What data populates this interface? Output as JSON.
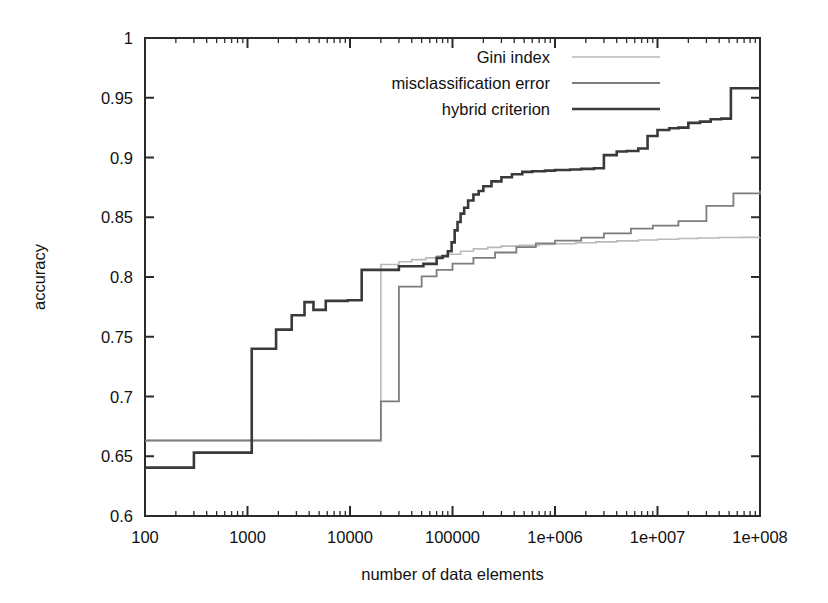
{
  "chart_data": {
    "type": "line",
    "title": "",
    "xlabel": "number of data elements",
    "ylabel": "accuracy",
    "xscale": "log",
    "xlim": [
      100,
      100000000
    ],
    "ylim": [
      0.6,
      1.0
    ],
    "grid": false,
    "legend_position": "top-right-inside",
    "xticks": [
      100,
      1000,
      10000,
      100000,
      1000000,
      10000000,
      100000000
    ],
    "xtick_labels": [
      "100",
      "1000",
      "10000",
      "100000",
      "1e+006",
      "1e+007",
      "1e+008"
    ],
    "yticks": [
      0.6,
      0.65,
      0.7,
      0.75,
      0.8,
      0.85,
      0.9,
      0.95,
      1
    ],
    "ytick_labels": [
      "0.6",
      "0.65",
      "0.7",
      "0.75",
      "0.8",
      "0.85",
      "0.9",
      "0.95",
      "1"
    ],
    "series": [
      {
        "name": "Gini index",
        "color": "#b9b9b9",
        "width": 1.6,
        "step": "post",
        "points": [
          [
            100,
            0.6632
          ],
          [
            300,
            0.6632
          ],
          [
            1000,
            0.6632
          ],
          [
            3000,
            0.6632
          ],
          [
            10000,
            0.6632
          ],
          [
            19000,
            0.6632
          ],
          [
            20000,
            0.8105
          ],
          [
            26000,
            0.8105
          ],
          [
            30000,
            0.8128
          ],
          [
            40000,
            0.8145
          ],
          [
            55000,
            0.816
          ],
          [
            70000,
            0.8175
          ],
          [
            90000,
            0.819
          ],
          [
            120000,
            0.8215
          ],
          [
            160000,
            0.8235
          ],
          [
            220000,
            0.8248
          ],
          [
            300000,
            0.8258
          ],
          [
            450000,
            0.8265
          ],
          [
            700000,
            0.8272
          ],
          [
            1000000,
            0.8278
          ],
          [
            1600000,
            0.8286
          ],
          [
            2500000,
            0.8294
          ],
          [
            4000000,
            0.8302
          ],
          [
            6500000,
            0.831
          ],
          [
            10000000,
            0.8316
          ],
          [
            16000000,
            0.8322
          ],
          [
            25000000,
            0.8326
          ],
          [
            40000000,
            0.833
          ],
          [
            65000000,
            0.8332
          ],
          [
            100000000,
            0.8333
          ]
        ]
      },
      {
        "name": "misclassification error",
        "color": "#7d7d7d",
        "width": 1.8,
        "step": "post",
        "points": [
          [
            100,
            0.6632
          ],
          [
            300,
            0.6632
          ],
          [
            1000,
            0.6632
          ],
          [
            3000,
            0.6632
          ],
          [
            10000,
            0.6632
          ],
          [
            19000,
            0.6632
          ],
          [
            20000,
            0.696
          ],
          [
            26000,
            0.696
          ],
          [
            30000,
            0.792
          ],
          [
            42000,
            0.792
          ],
          [
            50000,
            0.8005
          ],
          [
            62000,
            0.8005
          ],
          [
            70000,
            0.806
          ],
          [
            85000,
            0.806
          ],
          [
            100000,
            0.8112
          ],
          [
            130000,
            0.8112
          ],
          [
            160000,
            0.816
          ],
          [
            200000,
            0.816
          ],
          [
            260000,
            0.8205
          ],
          [
            330000,
            0.8205
          ],
          [
            420000,
            0.825
          ],
          [
            520000,
            0.825
          ],
          [
            650000,
            0.8282
          ],
          [
            820000,
            0.8282
          ],
          [
            1000000,
            0.8305
          ],
          [
            1400000,
            0.8305
          ],
          [
            1800000,
            0.833
          ],
          [
            2400000,
            0.833
          ],
          [
            3000000,
            0.8365
          ],
          [
            4200000,
            0.8365
          ],
          [
            5500000,
            0.8405
          ],
          [
            7000000,
            0.8405
          ],
          [
            9000000,
            0.843
          ],
          [
            12000000,
            0.843
          ],
          [
            16000000,
            0.8468
          ],
          [
            22000000,
            0.8468
          ],
          [
            30000000,
            0.8595
          ],
          [
            42000000,
            0.8595
          ],
          [
            55000000,
            0.87
          ],
          [
            75000000,
            0.87
          ],
          [
            100000000,
            0.8722
          ]
        ]
      },
      {
        "name": "hybrid criterion",
        "color": "#3a3a3a",
        "width": 2.6,
        "step": "post",
        "points": [
          [
            100,
            0.6405
          ],
          [
            200,
            0.6405
          ],
          [
            300,
            0.653
          ],
          [
            600,
            0.653
          ],
          [
            1000,
            0.653
          ],
          [
            1100,
            0.74
          ],
          [
            1500,
            0.74
          ],
          [
            1900,
            0.756
          ],
          [
            2400,
            0.756
          ],
          [
            2700,
            0.768
          ],
          [
            3200,
            0.768
          ],
          [
            3600,
            0.779
          ],
          [
            4100,
            0.779
          ],
          [
            4400,
            0.7725
          ],
          [
            5200,
            0.7725
          ],
          [
            5800,
            0.78
          ],
          [
            7000,
            0.78
          ],
          [
            8200,
            0.78
          ],
          [
            9500,
            0.7805
          ],
          [
            11000,
            0.7805
          ],
          [
            13000,
            0.806
          ],
          [
            18000,
            0.806
          ],
          [
            24000,
            0.806
          ],
          [
            30000,
            0.809
          ],
          [
            40000,
            0.809
          ],
          [
            52000,
            0.811
          ],
          [
            62000,
            0.811
          ],
          [
            70000,
            0.816
          ],
          [
            80000,
            0.8175
          ],
          [
            90000,
            0.8215
          ],
          [
            98000,
            0.829
          ],
          [
            105000,
            0.839
          ],
          [
            112000,
            0.846
          ],
          [
            120000,
            0.853
          ],
          [
            130000,
            0.858
          ],
          [
            142000,
            0.864
          ],
          [
            160000,
            0.869
          ],
          [
            180000,
            0.872
          ],
          [
            200000,
            0.876
          ],
          [
            240000,
            0.88
          ],
          [
            300000,
            0.8835
          ],
          [
            380000,
            0.886
          ],
          [
            480000,
            0.888
          ],
          [
            600000,
            0.8885
          ],
          [
            800000,
            0.889
          ],
          [
            1000000,
            0.8895
          ],
          [
            1400000,
            0.89
          ],
          [
            1800000,
            0.8905
          ],
          [
            2400000,
            0.891
          ],
          [
            3000000,
            0.902
          ],
          [
            4000000,
            0.905
          ],
          [
            5000000,
            0.9055
          ],
          [
            6500000,
            0.9075
          ],
          [
            8000000,
            0.918
          ],
          [
            10000000,
            0.923
          ],
          [
            13000000,
            0.9245
          ],
          [
            16000000,
            0.925
          ],
          [
            20000000,
            0.929
          ],
          [
            26000000,
            0.93
          ],
          [
            33000000,
            0.932
          ],
          [
            42000000,
            0.9325
          ],
          [
            52000000,
            0.958
          ],
          [
            70000000,
            0.958
          ],
          [
            100000000,
            0.958
          ]
        ]
      }
    ],
    "legend": [
      {
        "label": "Gini index",
        "color": "#b9b9b9"
      },
      {
        "label": "misclassification error",
        "color": "#7d7d7d"
      },
      {
        "label": "hybrid criterion",
        "color": "#3a3a3a"
      }
    ]
  }
}
